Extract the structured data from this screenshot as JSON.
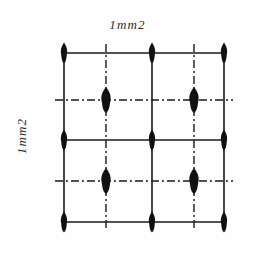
{
  "figure": {
    "title_top": "1mm2",
    "title_left": "1mm2",
    "background_color": "#fefefe",
    "ink_color": "#1a1a1a"
  },
  "labels": {
    "top": {
      "text": "1mm2",
      "orientation": "horizontal",
      "style": "italic"
    },
    "left": {
      "text": "1mm2",
      "orientation": "rotated-90-ccw",
      "style": "italic"
    }
  },
  "diagram": {
    "type": "symmetry-lattice",
    "solid_lines": {
      "stroke": "#1a1a1a",
      "width": 1.6,
      "vertical_x": [
        64,
        152,
        224
      ],
      "horizontal_y": [
        53,
        140,
        222
      ]
    },
    "dashdot_lines": {
      "stroke": "#1a1a1a",
      "width": 1.4,
      "pattern": "8,3,2,3",
      "vertical_x": [
        106,
        194
      ],
      "horizontal_y": [
        100,
        181
      ]
    },
    "axis_markers": {
      "shape": "lens",
      "fill": "#111111",
      "primary": {
        "label": "two-fold-axis-on-mirror",
        "half_width": 3.1,
        "half_height": 10.5,
        "points": [
          {
            "x": 64,
            "y": 53
          },
          {
            "x": 152,
            "y": 53
          },
          {
            "x": 224,
            "y": 53
          },
          {
            "x": 64,
            "y": 140
          },
          {
            "x": 152,
            "y": 140
          },
          {
            "x": 224,
            "y": 140
          },
          {
            "x": 64,
            "y": 222
          },
          {
            "x": 152,
            "y": 222
          },
          {
            "x": 224,
            "y": 222
          }
        ]
      },
      "secondary": {
        "label": "two-fold-axis-interstitial",
        "half_width": 4.6,
        "half_height": 13.0,
        "points": [
          {
            "x": 106,
            "y": 100
          },
          {
            "x": 194,
            "y": 100
          },
          {
            "x": 106,
            "y": 181
          },
          {
            "x": 194,
            "y": 181
          }
        ]
      }
    },
    "cell": {
      "left": 64,
      "top": 53,
      "right": 224,
      "bottom": 222,
      "columns": 2,
      "rows": 2
    }
  }
}
